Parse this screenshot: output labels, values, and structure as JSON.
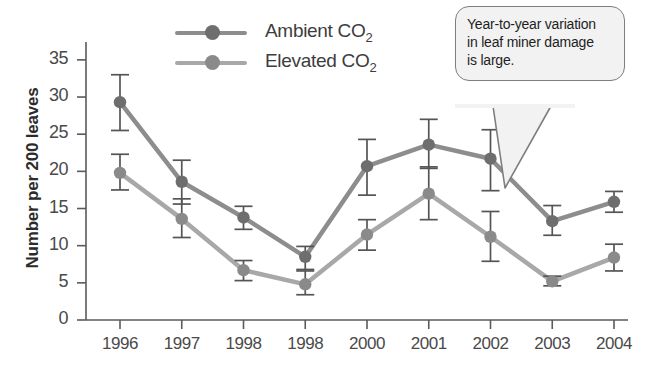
{
  "chart_data": {
    "type": "line",
    "title": "",
    "xlabel": "",
    "ylabel": "Number per 200 leaves",
    "categories": [
      "1996",
      "1997",
      "1998",
      "1998",
      "2000",
      "2001",
      "2002",
      "2003",
      "2004"
    ],
    "ylim": [
      0,
      37
    ],
    "yticks": [
      0,
      5,
      10,
      15,
      20,
      25,
      30,
      35
    ],
    "grid": false,
    "legend_position": "top-center",
    "error_bars": true,
    "series": [
      {
        "name": "Ambient CO2",
        "label": "Ambient CO",
        "sublabel": "2",
        "color": "#8d8d8d",
        "marker_color": "#6e6e6e",
        "values": [
          29.3,
          18.6,
          13.8,
          8.5,
          20.7,
          23.6,
          21.7,
          13.3,
          15.9
        ],
        "err_low": [
          25.5,
          15.6,
          12.2,
          6.8,
          16.8,
          20.4,
          17.4,
          11.4,
          14.5
        ],
        "err_high": [
          33.0,
          21.5,
          15.3,
          9.9,
          24.3,
          27.0,
          25.6,
          15.4,
          17.3
        ]
      },
      {
        "name": "Elevated CO2",
        "label": "Elevated CO",
        "sublabel": "2",
        "color": "#a8a8a8",
        "marker_color": "#8a8a8a",
        "values": [
          19.8,
          13.6,
          6.7,
          4.8,
          11.5,
          17.0,
          11.2,
          5.2,
          8.4
        ],
        "err_low": [
          17.5,
          11.1,
          5.3,
          3.4,
          9.4,
          13.5,
          7.9,
          4.6,
          6.6
        ],
        "err_high": [
          22.3,
          16.3,
          8.0,
          6.6,
          13.5,
          20.6,
          14.6,
          5.9,
          10.2
        ]
      }
    ],
    "annotation": {
      "text": "Year-to-year variation in leaf miner damage is large.",
      "lines": [
        "Year-to-year variation",
        "in leaf miner damage",
        "is large."
      ]
    }
  },
  "colors": {
    "axis": "#5a5a5a",
    "text": "#4a4a4a",
    "callout_fill": "#f2f2f2",
    "callout_border": "#7e7e7e"
  }
}
